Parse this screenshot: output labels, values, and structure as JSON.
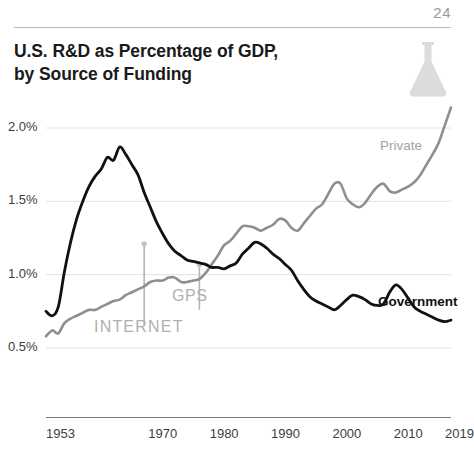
{
  "page": {
    "number": "24",
    "icon": "flask-icon"
  },
  "header": {
    "title_line1": "U.S. R&D as Percentage of GDP,",
    "title_line2": "by Source of Funding"
  },
  "colors": {
    "government": "#111111",
    "private": "#8f8f8f",
    "grid": "#e2e2e2",
    "axis": "#7d7d7d",
    "annotation": "#b0b0b0",
    "page_number": "#9a9a9a",
    "flask": "#dcdcdc"
  },
  "chart_data": {
    "type": "line",
    "title": "U.S. R&D as Percentage of GDP, by Source of Funding",
    "xlabel": "",
    "ylabel": "",
    "grid": true,
    "legend_position": "inline-right",
    "xlim": [
      1953,
      2019
    ],
    "ylim": [
      0.5,
      2.2
    ],
    "yticks": [
      0.5,
      1.0,
      1.5,
      2.0
    ],
    "ytick_labels": [
      "0.5%",
      "1.0%",
      "1.5%",
      "2.0%"
    ],
    "xticks": [
      1953,
      1970,
      1980,
      1990,
      2000,
      2010,
      2019
    ],
    "xtick_labels": [
      "1953",
      "1970",
      "1980",
      "1990",
      "2000",
      "2010",
      "2019"
    ],
    "annotations": [
      {
        "label": "INTERNET",
        "x": 1969,
        "y_top": 1.21,
        "y_bottom": 0.66
      },
      {
        "label": "GPS",
        "x": 1978,
        "y_top": 1.07,
        "y_bottom": 0.76
      }
    ],
    "series": [
      {
        "name": "Government",
        "color": "#111111",
        "label_text": "Government",
        "x": [
          1953,
          1954,
          1955,
          1956,
          1957,
          1958,
          1959,
          1960,
          1961,
          1962,
          1963,
          1964,
          1965,
          1966,
          1967,
          1968,
          1969,
          1970,
          1971,
          1972,
          1973,
          1974,
          1975,
          1976,
          1977,
          1978,
          1979,
          1980,
          1981,
          1982,
          1983,
          1984,
          1985,
          1986,
          1987,
          1988,
          1989,
          1990,
          1991,
          1992,
          1993,
          1994,
          1995,
          1996,
          1997,
          1998,
          1999,
          2000,
          2001,
          2002,
          2003,
          2004,
          2005,
          2006,
          2007,
          2008,
          2009,
          2010,
          2011,
          2012,
          2013,
          2014,
          2015,
          2016,
          2017,
          2018,
          2019
        ],
        "values": [
          0.75,
          0.72,
          0.78,
          1.02,
          1.22,
          1.38,
          1.5,
          1.6,
          1.67,
          1.72,
          1.8,
          1.78,
          1.87,
          1.82,
          1.75,
          1.68,
          1.56,
          1.46,
          1.36,
          1.28,
          1.21,
          1.16,
          1.13,
          1.1,
          1.09,
          1.08,
          1.07,
          1.05,
          1.05,
          1.04,
          1.06,
          1.08,
          1.14,
          1.18,
          1.22,
          1.21,
          1.18,
          1.14,
          1.11,
          1.07,
          1.03,
          0.96,
          0.9,
          0.85,
          0.82,
          0.8,
          0.78,
          0.76,
          0.79,
          0.83,
          0.86,
          0.85,
          0.83,
          0.8,
          0.79,
          0.8,
          0.88,
          0.93,
          0.9,
          0.84,
          0.78,
          0.75,
          0.73,
          0.71,
          0.69,
          0.68,
          0.69
        ]
      },
      {
        "name": "Private",
        "color": "#8f8f8f",
        "label_text": "Private",
        "x": [
          1953,
          1954,
          1955,
          1956,
          1957,
          1958,
          1959,
          1960,
          1961,
          1962,
          1963,
          1964,
          1965,
          1966,
          1967,
          1968,
          1969,
          1970,
          1971,
          1972,
          1973,
          1974,
          1975,
          1976,
          1977,
          1978,
          1979,
          1980,
          1981,
          1982,
          1983,
          1984,
          1985,
          1986,
          1987,
          1988,
          1989,
          1990,
          1991,
          1992,
          1993,
          1994,
          1995,
          1996,
          1997,
          1998,
          1999,
          2000,
          2001,
          2002,
          2003,
          2004,
          2005,
          2006,
          2007,
          2008,
          2009,
          2010,
          2011,
          2012,
          2013,
          2014,
          2015,
          2016,
          2017,
          2018,
          2019
        ],
        "values": [
          0.58,
          0.62,
          0.6,
          0.67,
          0.7,
          0.72,
          0.74,
          0.76,
          0.76,
          0.78,
          0.8,
          0.82,
          0.83,
          0.86,
          0.88,
          0.9,
          0.92,
          0.95,
          0.96,
          0.96,
          0.98,
          0.98,
          0.95,
          0.95,
          0.96,
          0.97,
          1.01,
          1.07,
          1.13,
          1.2,
          1.23,
          1.28,
          1.33,
          1.33,
          1.32,
          1.3,
          1.32,
          1.34,
          1.38,
          1.37,
          1.32,
          1.3,
          1.35,
          1.4,
          1.45,
          1.48,
          1.55,
          1.62,
          1.62,
          1.52,
          1.48,
          1.46,
          1.49,
          1.55,
          1.6,
          1.62,
          1.57,
          1.56,
          1.58,
          1.6,
          1.63,
          1.68,
          1.75,
          1.82,
          1.9,
          2.02,
          2.14
        ]
      }
    ]
  }
}
